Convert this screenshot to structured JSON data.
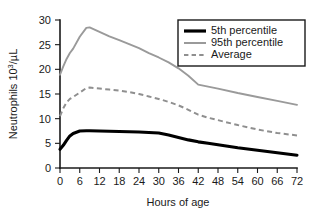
{
  "chart_data": {
    "type": "line",
    "title": "",
    "xlabel": "Hours of age",
    "ylabel": "Neutrophils 10",
    "ylabel_sup": "3",
    "ylabel_tail": "/µL",
    "xlim": [
      0,
      72
    ],
    "ylim": [
      0,
      30
    ],
    "xticks": [
      0,
      6,
      12,
      18,
      24,
      30,
      36,
      42,
      48,
      54,
      60,
      66,
      72
    ],
    "yticks": [
      0,
      5,
      10,
      15,
      20,
      25,
      30
    ],
    "grid": false,
    "legend_position": "top-right",
    "x": [
      0,
      1,
      2,
      3,
      4,
      6,
      8,
      9,
      12,
      15,
      18,
      21,
      24,
      27,
      30,
      33,
      36,
      39,
      42,
      45,
      48,
      54,
      60,
      66,
      72
    ],
    "series": [
      {
        "name": "5th percentile",
        "color": "#000000",
        "style": "solid",
        "width": "thick",
        "values": [
          3.8,
          4.6,
          5.6,
          6.5,
          7.0,
          7.5,
          7.55,
          7.55,
          7.5,
          7.45,
          7.4,
          7.35,
          7.3,
          7.2,
          7.1,
          6.7,
          6.2,
          5.7,
          5.3,
          5.0,
          4.7,
          4.1,
          3.6,
          3.1,
          2.6
        ]
      },
      {
        "name": "95th percentile",
        "color": "#9a9a9a",
        "style": "solid",
        "width": "thin",
        "values": [
          18.9,
          20.6,
          22.1,
          23.3,
          24.2,
          26.6,
          28.4,
          28.5,
          27.6,
          26.7,
          25.9,
          25.1,
          24.3,
          23.3,
          22.4,
          21.4,
          20.2,
          18.7,
          16.9,
          16.5,
          16.1,
          15.2,
          14.4,
          13.6,
          12.8
        ]
      },
      {
        "name": "Average",
        "color": "#8f8f8f",
        "style": "dashed",
        "width": "medium",
        "values": [
          10.5,
          12.1,
          13.3,
          14.0,
          14.4,
          15.3,
          16.2,
          16.3,
          16.1,
          15.9,
          15.7,
          15.4,
          15.0,
          14.5,
          14.0,
          13.4,
          12.7,
          11.8,
          10.8,
          10.2,
          9.7,
          8.7,
          7.8,
          7.1,
          6.6
        ]
      }
    ]
  },
  "legend": {
    "items": [
      {
        "label": "5th percentile"
      },
      {
        "label": "95th percentile"
      },
      {
        "label": "Average"
      }
    ]
  }
}
